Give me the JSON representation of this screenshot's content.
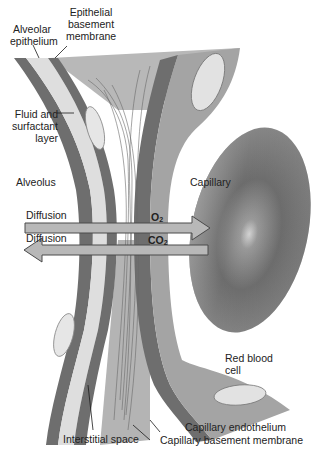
{
  "diagram": {
    "colors": {
      "background": "#ffffff",
      "dark_membrane": "#6e6e6e",
      "light_layer": "#dcdcdc",
      "mid_layer": "#a8a8a8",
      "interstitial": "#b4b4b4",
      "capillary_wall": "#9a9a9a",
      "red_blood_cell": "#7c7c7c",
      "arrow_fill": "#b8b8b8",
      "arrow_stroke": "#4a4a4a",
      "text": "#222222"
    },
    "labels": {
      "alveolar_epithelium": "Alveolar\nepithelium",
      "epithelial_basement_membrane": "Epithelial\nbasement\nmembrane",
      "fluid_surfactant_layer": "Fluid and\nsurfactant\nlayer",
      "alveolus": "Alveolus",
      "capillary": "Capillary",
      "diffusion_o2": "Diffusion",
      "diffusion_co2": "Diffusion",
      "o2": "O",
      "o2_sub": "2",
      "co2": "CO",
      "co2_sub": "2",
      "red_blood_cell": "Red blood\ncell",
      "interstitial_space": "Interstitial space",
      "capillary_endothelium": "Capillary endothelium",
      "capillary_basement_membrane": "Capillary basement membrane"
    },
    "arrows": [
      {
        "name": "o2-diffusion-arrow",
        "direction": "right",
        "from": "alveolus",
        "to": "capillary",
        "gas": "O2"
      },
      {
        "name": "co2-diffusion-arrow",
        "direction": "left",
        "from": "capillary",
        "to": "alveolus",
        "gas": "CO2"
      }
    ]
  }
}
